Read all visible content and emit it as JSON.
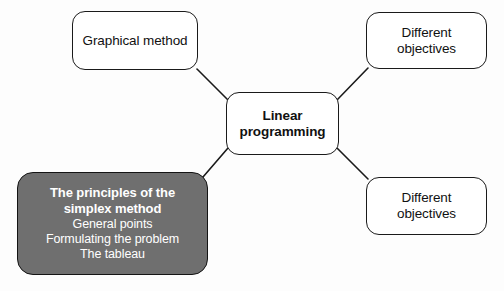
{
  "diagram": {
    "background_color": "#fdfdfd",
    "line_color": "#1a1a1a",
    "highlight_fill": "#6f6f6f",
    "highlight_text_color": "#ffffff",
    "center": {
      "lines": [
        "Linear",
        "programming"
      ]
    },
    "nodes": {
      "graphical": {
        "lines": [
          "Graphical method"
        ]
      },
      "objectives_top": {
        "lines": [
          "Different",
          "objectives"
        ]
      },
      "objectives_bottom": {
        "lines": [
          "Different",
          "objectives"
        ]
      },
      "simplex": {
        "title_lines": [
          "The principles of the",
          "simplex method"
        ],
        "sub_lines": [
          "General points",
          "Formulating the problem",
          "The tableau"
        ]
      }
    },
    "connectors": [
      {
        "name": "center-to-graphical",
        "from": "center-top-left",
        "to": "graphical-bottom-right"
      },
      {
        "name": "center-to-objectives-top",
        "from": "center-top-right",
        "to": "objectives-top-bottom-left"
      },
      {
        "name": "center-to-simplex",
        "from": "center-bottom-left",
        "to": "simplex-top-right"
      },
      {
        "name": "center-to-objectives-bottom",
        "from": "center-bottom-right",
        "to": "objectives-bottom-top-left"
      }
    ]
  }
}
